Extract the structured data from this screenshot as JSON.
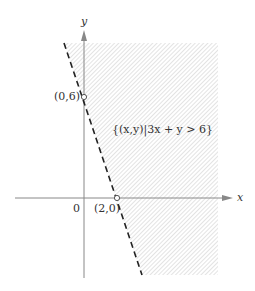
{
  "figure": {
    "axis_labels": {
      "x": "x",
      "y": "y"
    },
    "origin_label": "0",
    "points": [
      {
        "label": "(0,6)",
        "x": 0,
        "y": 6
      },
      {
        "label": "(2,0)",
        "x": 2,
        "y": 0
      }
    ],
    "region_label": "{(x,y)|3x + y > 6}",
    "boundary_line": "3x + y = 6",
    "boundary_style": "dashed",
    "colors": {
      "axis": "#888888",
      "boundary": "#222222",
      "hatch": "#c8c8c8",
      "text": "#333333"
    }
  }
}
